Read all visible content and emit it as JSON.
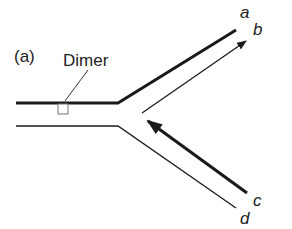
{
  "figure": {
    "panel_label": "(a)",
    "annotation": "Dimer",
    "strand_labels": {
      "a": "a",
      "b": "b",
      "c": "c",
      "d": "d"
    }
  },
  "colors": {
    "line": "#1a1a1a",
    "dimer_box": "#777777",
    "text": "#222222"
  }
}
